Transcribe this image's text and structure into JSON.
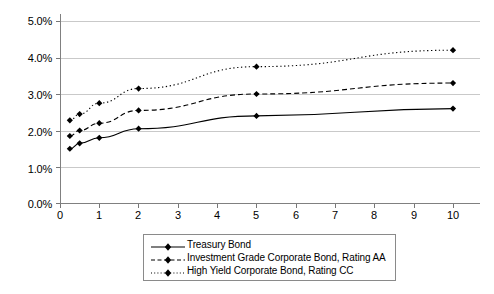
{
  "chart_data": {
    "type": "line",
    "title": "",
    "xlabel": "",
    "ylabel": "",
    "xlim": [
      0,
      10.8
    ],
    "ylim": [
      0,
      0.05
    ],
    "grid": true,
    "legend_position": "bottom-center",
    "x": [
      0.25,
      0.5,
      1,
      2,
      5,
      10
    ],
    "x_ticks": [
      0,
      1,
      2,
      3,
      4,
      5,
      6,
      7,
      8,
      9,
      10
    ],
    "x_tick_labels": [
      "0",
      "1",
      "2",
      "3",
      "4",
      "5",
      "6",
      "7",
      "8",
      "9",
      "10"
    ],
    "y_ticks": [
      0.0,
      0.01,
      0.02,
      0.03,
      0.04,
      0.05
    ],
    "y_tick_labels": [
      "0.0%",
      "1.0%",
      "2.0%",
      "3.0%",
      "4.0%",
      "5.0%"
    ],
    "series": [
      {
        "name": "Treasury Bond",
        "style": "solid",
        "marker": "diamond",
        "color": "#000000",
        "values": [
          1.5,
          1.65,
          1.8,
          2.05,
          2.4,
          2.6
        ]
      },
      {
        "name": "Investment Grade Corporate Bond, Rating AA",
        "style": "dashed",
        "marker": "diamond",
        "color": "#000000",
        "values": [
          1.85,
          2.0,
          2.2,
          2.55,
          3.0,
          3.3
        ]
      },
      {
        "name": "High Yield Corporate Bond, Rating CC",
        "style": "dotted",
        "marker": "diamond",
        "color": "#000000",
        "values": [
          2.28,
          2.45,
          2.75,
          3.15,
          3.75,
          4.2
        ]
      }
    ]
  },
  "legend": {
    "items": [
      {
        "label": "Treasury Bond",
        "style": "solid"
      },
      {
        "label": "Investment Grade Corporate Bond, Rating AA",
        "style": "dashed"
      },
      {
        "label": "High Yield Corporate Bond, Rating CC",
        "style": "dotted"
      }
    ]
  },
  "caption": {
    "text": ""
  },
  "colors": {
    "series": "#000000",
    "gridline": "#c9c9c9",
    "axis": "#808080",
    "legend_border": "#8a8a8a",
    "background": "#ffffff"
  }
}
